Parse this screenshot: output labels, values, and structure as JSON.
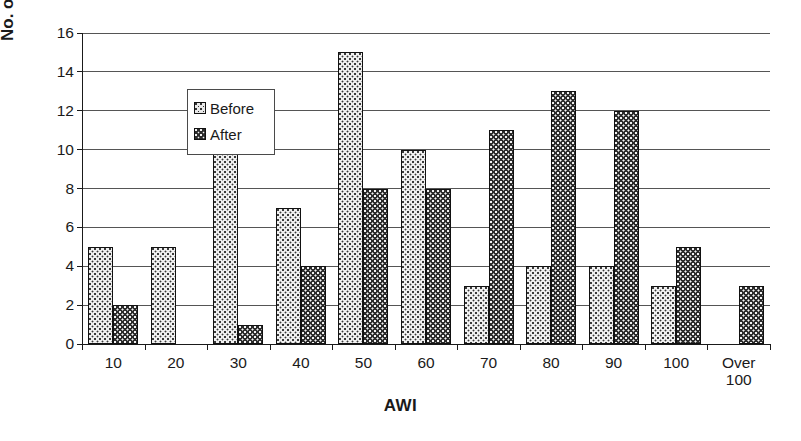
{
  "chart_data": {
    "type": "bar",
    "title": "",
    "xlabel": "AWI",
    "ylabel": "No. of properties",
    "categories": [
      "10",
      "20",
      "30",
      "40",
      "50",
      "60",
      "70",
      "80",
      "90",
      "100",
      "Over\n100"
    ],
    "category_labels": [
      {
        "line1": "10",
        "line2": ""
      },
      {
        "line1": "20",
        "line2": ""
      },
      {
        "line1": "30",
        "line2": ""
      },
      {
        "line1": "40",
        "line2": ""
      },
      {
        "line1": "50",
        "line2": ""
      },
      {
        "line1": "60",
        "line2": ""
      },
      {
        "line1": "70",
        "line2": ""
      },
      {
        "line1": "80",
        "line2": ""
      },
      {
        "line1": "90",
        "line2": ""
      },
      {
        "line1": "100",
        "line2": ""
      },
      {
        "line1": "Over",
        "line2": "100"
      }
    ],
    "series": [
      {
        "name": "Before",
        "values": [
          5,
          5,
          11,
          7,
          15,
          10,
          3,
          4,
          4,
          3,
          0
        ]
      },
      {
        "name": "After",
        "values": [
          2,
          0,
          1,
          4,
          8,
          8,
          11,
          13,
          12,
          5,
          3
        ]
      }
    ],
    "ylim": [
      0,
      16
    ],
    "ytick_step": 2,
    "yticks": [
      "0",
      "2",
      "4",
      "6",
      "8",
      "10",
      "12",
      "14",
      "16"
    ],
    "grid": true,
    "legend_position": "inside-top-left",
    "colors": {
      "before_fill": "#f0f0f0",
      "before_dots": "#3a3a3a",
      "after_fill": "#2b2b2b",
      "after_dots": "#f2f2f2",
      "axis": "#1a1a1a",
      "gridline": "#555555",
      "background": "#ffffff"
    }
  },
  "legend": {
    "items": [
      {
        "label": "Before"
      },
      {
        "label": "After"
      }
    ]
  }
}
